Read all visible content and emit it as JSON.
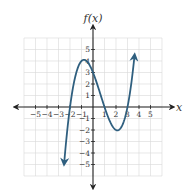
{
  "chart_data": {
    "type": "line",
    "title": "",
    "xlabel": "x",
    "ylabel": "f(x)",
    "xlim": [
      -6,
      6
    ],
    "ylim": [
      -6,
      6
    ],
    "grid": true,
    "x_ticks": [
      -5,
      -4,
      -3,
      -2,
      -1,
      1,
      2,
      3,
      4,
      5
    ],
    "y_ticks": [
      5,
      4,
      3,
      2,
      1,
      -1,
      -2,
      -3,
      -4,
      -5
    ],
    "x_tick_labels": [
      "−5",
      "−4",
      "−3",
      "−2",
      "−1",
      "1",
      "2",
      "3",
      "4",
      "5"
    ],
    "y_tick_labels": [
      "5",
      "4",
      "3",
      "2",
      "1",
      "−1",
      "−2",
      "−3",
      "−4",
      "−5"
    ],
    "series": [
      {
        "name": "f(x)",
        "function": "0.5*(x+2)*(x-1)*(x-3)",
        "x_range": [
          -2.5,
          3.6
        ],
        "key_points": [
          {
            "x": -2,
            "y": 0,
            "label": "root"
          },
          {
            "x": -1,
            "y": 4,
            "label": "local max"
          },
          {
            "x": 0,
            "y": 3,
            "label": "y-intercept"
          },
          {
            "x": 1,
            "y": 0,
            "label": "root"
          },
          {
            "x": 2,
            "y": -2,
            "label": "local min"
          },
          {
            "x": 3,
            "y": 0,
            "label": "root"
          }
        ],
        "end_arrows": true,
        "color": "#2f5f7f"
      }
    ]
  },
  "colors": {
    "curve": "#2f5f7f",
    "axis": "#222222",
    "grid": "#d8d8d8"
  },
  "labels": {
    "x_axis": "x",
    "y_axis": "f(x)"
  }
}
